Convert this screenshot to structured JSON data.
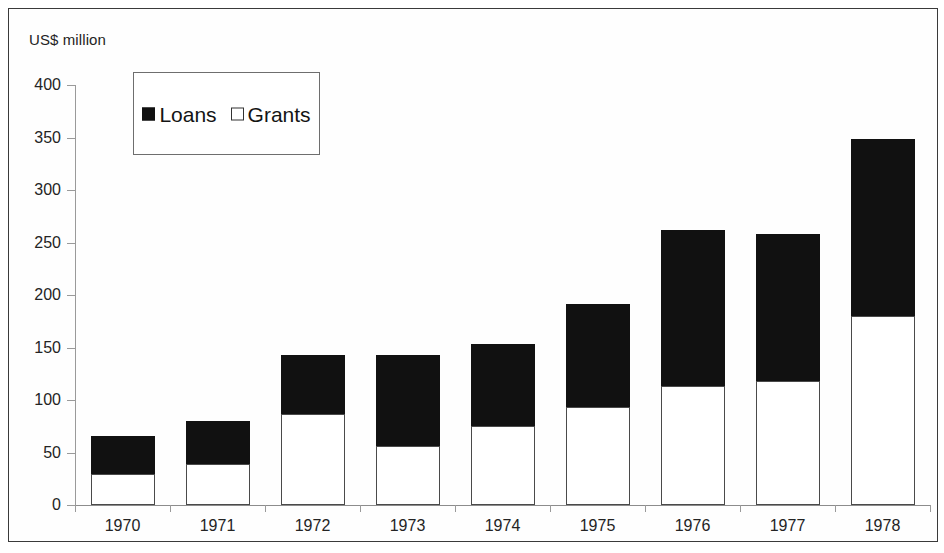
{
  "figure": {
    "axis_unit_label": "US$ million"
  },
  "legend": {
    "entries": [
      {
        "label": "Loans",
        "swatch": "black-filled-square-icon",
        "color": "#111111"
      },
      {
        "label": "Grants",
        "swatch": "white-open-square-icon",
        "color": "#ffffff"
      }
    ]
  },
  "chart_data": {
    "type": "bar",
    "subtype": "stacked-bar",
    "title": "",
    "subtitle": "",
    "xlabel": "",
    "ylabel": "US$ million",
    "ylim": [
      0,
      400
    ],
    "ytick_labels": [
      "0",
      "50",
      "100",
      "150",
      "200",
      "250",
      "300",
      "350",
      "400"
    ],
    "ytick_values": [
      0,
      50,
      100,
      150,
      200,
      250,
      300,
      350,
      400
    ],
    "grid": false,
    "legend_position": "top-left-inset",
    "categories": [
      "1970",
      "1971",
      "1972",
      "1973",
      "1974",
      "1975",
      "1976",
      "1977",
      "1978"
    ],
    "series": [
      {
        "name": "Grants",
        "color": "#ffffff",
        "values": [
          30,
          39,
          87,
          56,
          75,
          93,
          113,
          118,
          180
        ]
      },
      {
        "name": "Loans",
        "color": "#111111",
        "values": [
          36,
          41,
          56,
          87,
          78,
          98,
          149,
          140,
          169
        ]
      }
    ],
    "totals": [
      66,
      80,
      143,
      143,
      153,
      191,
      262,
      258,
      349
    ]
  }
}
